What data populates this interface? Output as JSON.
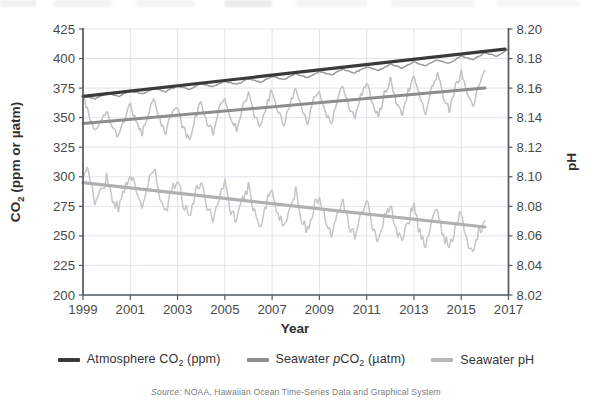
{
  "figure": {
    "source_note_keyword": "Source:",
    "source_note_text": " NOAA, Hawaiian Ocean Time-Series Data and Graphical System"
  },
  "axes": {
    "x_title": "Year",
    "y_left_title_main": "CO",
    "y_left_title_sub": "2",
    "y_left_title_rest": " (ppm or µatm)",
    "y_right_title": "pH",
    "x_ticks": [
      "1999",
      "2001",
      "2003",
      "2005",
      "2007",
      "2009",
      "2011",
      "2013",
      "2015",
      "2017"
    ],
    "y_left_ticks": [
      "425",
      "400",
      "375",
      "350",
      "325",
      "300",
      "275",
      "250",
      "225",
      "200"
    ],
    "y_right_ticks": [
      "8.20",
      "8.18",
      "8.16",
      "8.14",
      "8.12",
      "8.10",
      "8.08",
      "8.06",
      "8.04",
      "8.02"
    ]
  },
  "legend": {
    "items": [
      {
        "name": "atmosphere-co2",
        "pre": "Atmosphere CO",
        "sub": "2",
        "post": " (ppm)",
        "color": "#3a3a3a"
      },
      {
        "name": "seawater-pco2",
        "pre": "Seawater ",
        "ital": "p",
        "pre2": "CO",
        "sub": "2",
        "post": " (µatm)",
        "color": "#8d8d8d"
      },
      {
        "name": "seawater-ph",
        "pre": "Seawater pH",
        "sub": "",
        "post": "",
        "color": "#b8b8b8"
      }
    ]
  },
  "colors": {
    "atmosphere_co2": "#3a3a3a",
    "seawater_pco2_trend": "#8d8d8d",
    "seawater_pco2_data": "#c2c2c2",
    "seawater_ph_trend": "#b0b0b0",
    "seawater_ph_data": "#c6c6c6",
    "gridline": "#d8dde4",
    "axis": "#555a5f"
  },
  "chart_data": {
    "type": "line",
    "title": "",
    "xlabel": "Year",
    "ylabel": "CO2 (ppm or µatm)",
    "y2label": "pH",
    "xlim": [
      1999,
      2017
    ],
    "ylim": [
      200,
      425
    ],
    "y2lim": [
      8.02,
      8.2
    ],
    "ytick_step": 25,
    "y2tick_step": 0.02,
    "xtick_step": 2,
    "grid": true,
    "legend_position": "bottom",
    "series": [
      {
        "name": "Atmosphere CO2 (ppm)",
        "axis": "left",
        "units": "ppm",
        "color": "#3a3a3a",
        "style": "observed-with-seasonal-cycle",
        "trend_start_value": 368,
        "trend_end_value": 408,
        "seasonal_amplitude_ppm": 3,
        "x": [
          1999,
          1999.5,
          2000,
          2000.5,
          2001,
          2001.5,
          2002,
          2002.5,
          2003,
          2003.5,
          2004,
          2004.5,
          2005,
          2005.5,
          2006,
          2006.5,
          2007,
          2007.5,
          2008,
          2008.5,
          2009,
          2009.5,
          2010,
          2010.5,
          2011,
          2011.5,
          2012,
          2012.5,
          2013,
          2013.5,
          2014,
          2014.5,
          2015,
          2015.5,
          2016,
          2016.5,
          2017
        ],
        "values": [
          369,
          366,
          371,
          368,
          373,
          370,
          375,
          372,
          377,
          374,
          379,
          376,
          381,
          378,
          383,
          380,
          385,
          382,
          387,
          384,
          389,
          386,
          391,
          388,
          393,
          390,
          395,
          392,
          397,
          394,
          399,
          396,
          402,
          399,
          405,
          402,
          408
        ]
      },
      {
        "name": "Seawater pCO2 (µatm)",
        "axis": "left",
        "units": "µatm",
        "color": "#8d8d8d",
        "style": "noisy-observed-with-linear-trend",
        "trend_start_value": 345,
        "trend_end_value": 375,
        "trend_x_range": [
          1999,
          2016
        ],
        "seasonal_amplitude_uatm": 18,
        "x": [
          1999,
          1999.25,
          1999.5,
          1999.75,
          2000,
          2000.25,
          2000.5,
          2000.75,
          2001,
          2001.25,
          2001.5,
          2001.75,
          2002,
          2002.25,
          2002.5,
          2002.75,
          2003,
          2003.25,
          2003.5,
          2003.75,
          2004,
          2004.25,
          2004.5,
          2004.75,
          2005,
          2005.25,
          2005.5,
          2005.75,
          2006,
          2006.25,
          2006.5,
          2006.75,
          2007,
          2007.25,
          2007.5,
          2007.75,
          2008,
          2008.25,
          2008.5,
          2008.75,
          2009,
          2009.25,
          2009.5,
          2009.75,
          2010,
          2010.25,
          2010.5,
          2010.75,
          2011,
          2011.25,
          2011.5,
          2011.75,
          2012,
          2012.25,
          2012.5,
          2012.75,
          2013,
          2013.25,
          2013.5,
          2013.75,
          2014,
          2014.25,
          2014.5,
          2014.75,
          2015,
          2015.25,
          2015.5,
          2015.75,
          2016
        ],
        "values": [
          370,
          352,
          338,
          345,
          356,
          342,
          334,
          348,
          362,
          346,
          336,
          352,
          366,
          348,
          338,
          354,
          358,
          340,
          332,
          350,
          364,
          346,
          338,
          356,
          368,
          350,
          340,
          358,
          370,
          352,
          342,
          360,
          374,
          356,
          344,
          362,
          376,
          358,
          346,
          364,
          372,
          354,
          344,
          366,
          378,
          360,
          348,
          368,
          380,
          362,
          350,
          370,
          382,
          364,
          352,
          372,
          384,
          366,
          354,
          374,
          386,
          368,
          356,
          376,
          388,
          370,
          358,
          378,
          390
        ]
      },
      {
        "name": "Seawater pH",
        "axis": "right",
        "units": "pH",
        "color": "#b0b0b0",
        "style": "noisy-observed-with-linear-trend",
        "trend_start_value": 8.096,
        "trend_end_value": 8.066,
        "trend_x_range": [
          1999,
          2016
        ],
        "seasonal_amplitude_ph": 0.012,
        "x": [
          1999,
          1999.25,
          1999.5,
          1999.75,
          2000,
          2000.25,
          2000.5,
          2000.75,
          2001,
          2001.25,
          2001.5,
          2001.75,
          2002,
          2002.25,
          2002.5,
          2002.75,
          2003,
          2003.25,
          2003.5,
          2003.75,
          2004,
          2004.25,
          2004.5,
          2004.75,
          2005,
          2005.25,
          2005.5,
          2005.75,
          2006,
          2006.25,
          2006.5,
          2006.75,
          2007,
          2007.25,
          2007.5,
          2007.75,
          2008,
          2008.25,
          2008.5,
          2008.75,
          2009,
          2009.25,
          2009.5,
          2009.75,
          2010,
          2010.25,
          2010.5,
          2010.75,
          2011,
          2011.25,
          2011.5,
          2011.75,
          2012,
          2012.25,
          2012.5,
          2012.75,
          2013,
          2013.25,
          2013.5,
          2013.75,
          2014,
          2014.25,
          2014.5,
          2014.75,
          2015,
          2015.25,
          2015.5,
          2015.75,
          2016
        ],
        "values": [
          8.098,
          8.105,
          8.082,
          8.09,
          8.1,
          8.086,
          8.078,
          8.092,
          8.104,
          8.088,
          8.08,
          8.094,
          8.106,
          8.086,
          8.076,
          8.09,
          8.1,
          8.082,
          8.074,
          8.088,
          8.098,
          8.08,
          8.072,
          8.086,
          8.096,
          8.078,
          8.07,
          8.084,
          8.094,
          8.076,
          8.068,
          8.082,
          8.092,
          8.074,
          8.066,
          8.08,
          8.09,
          8.072,
          8.064,
          8.078,
          8.088,
          8.07,
          8.062,
          8.076,
          8.086,
          8.068,
          8.06,
          8.074,
          8.084,
          8.066,
          8.058,
          8.072,
          8.082,
          8.064,
          8.056,
          8.07,
          8.08,
          8.062,
          8.054,
          8.068,
          8.078,
          8.06,
          8.052,
          8.066,
          8.076,
          8.058,
          8.046,
          8.064,
          8.07
        ]
      }
    ]
  }
}
